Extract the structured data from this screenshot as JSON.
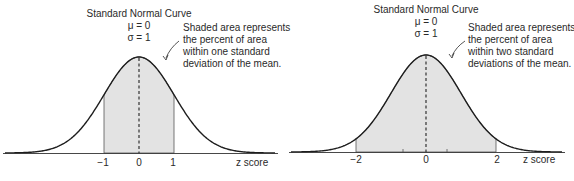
{
  "chart_data": [
    {
      "type": "area",
      "title": "Standard Normal Curve",
      "params": {
        "mu": "μ = 0",
        "sigma": "σ = 1"
      },
      "annotation": [
        "Shaded area represents",
        "the percent of area",
        "within one standard",
        "deviation of the mean."
      ],
      "xlabel": "z score",
      "x_ticks": [
        "−1",
        "0",
        "1"
      ],
      "shaded_range": [
        -1,
        1
      ],
      "xlim": [
        -3.85,
        3.85
      ],
      "mean_line": "dashed",
      "grid": false
    },
    {
      "type": "area",
      "title": "Standard Normal Curve",
      "params": {
        "mu": "μ = 0",
        "sigma": "σ = 1"
      },
      "annotation": [
        "Shaded area represents",
        "the percent of area",
        "within two standard",
        "deviations of the mean."
      ],
      "xlabel": "z score",
      "x_ticks": [
        "−2",
        "0",
        "2"
      ],
      "shaded_range": [
        -2,
        2
      ],
      "xlim": [
        -3.85,
        3.85
      ],
      "mean_line": "dashed",
      "grid": false
    }
  ],
  "colors": {
    "shade": "#e3e3e3",
    "line": "#1e1e1e",
    "text": "#2a2a2a"
  }
}
